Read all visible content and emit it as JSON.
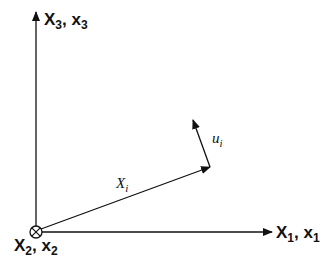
{
  "diagram": {
    "type": "coordinate-frame",
    "axes": {
      "x3": {
        "main": "X",
        "sub": "3",
        "sep": ", ",
        "main2": "x",
        "sub2": "3",
        "direction": "up"
      },
      "x1": {
        "main": "X",
        "sub": "1",
        "sep": ", ",
        "main2": "x",
        "sub2": "1",
        "direction": "right"
      },
      "x2": {
        "main": "X",
        "sub": "2",
        "sep": ", ",
        "main2": "x",
        "sub2": "2",
        "direction": "into-page",
        "symbol": "circled-cross"
      }
    },
    "vectors": {
      "position": {
        "main": "X",
        "sub": "i"
      },
      "displacement": {
        "main": "u",
        "sub": "i"
      }
    },
    "colors": {
      "stroke": "#111111",
      "background": "#ffffff"
    }
  }
}
